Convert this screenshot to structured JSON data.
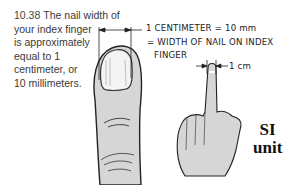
{
  "figure": {
    "number": "10.38",
    "caption_lines": [
      "The nail width of",
      "your index finger",
      "is approximately",
      "equal to 1",
      "centimeter, or",
      "10 millimeters."
    ]
  },
  "annotations": {
    "line1": "1 CENTIMETER = 10 mm",
    "line2": "= WIDTH OF NAIL ON INDEX",
    "line3": "FINGER",
    "small_scale": "1 cm"
  },
  "badge": {
    "line1": "SI",
    "line2": "unit"
  },
  "colors": {
    "skin_fill": "#d6d6d6",
    "outline": "#222222",
    "text": "#333333"
  }
}
